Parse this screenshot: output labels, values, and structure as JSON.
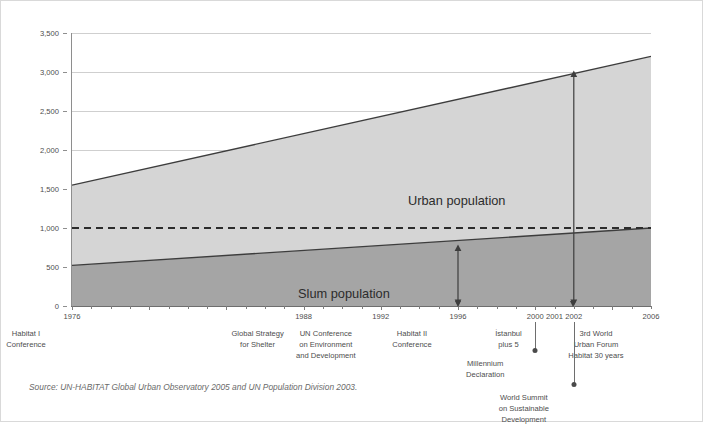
{
  "figure": {
    "y_axis_title": "Slum and urban population (millions)",
    "source_note": "Source: UN-HABITAT Global Urban Observatory 2005 and UN Population Division 2003.",
    "area_labels": {
      "urban": "Urban population",
      "slum": "Slum population"
    }
  },
  "chart_data": {
    "type": "area",
    "title": "",
    "xlabel": "",
    "ylabel": "Slum and urban population (millions)",
    "xlim": [
      1976,
      2006
    ],
    "ylim": [
      0,
      3500
    ],
    "ytick_values": [
      0,
      500,
      1000,
      1500,
      2000,
      2500,
      3000,
      3500
    ],
    "ytick_labels": [
      "0",
      "500",
      "1,000",
      "1,500",
      "2,000",
      "2,500",
      "3,000",
      "3,500"
    ],
    "grid": true,
    "legend_position": "inside-annotations",
    "reference_line": {
      "value": 1000,
      "style": "dashed",
      "label": ""
    },
    "x": [
      1976,
      2006
    ],
    "series": [
      {
        "name": "Urban population",
        "values": [
          1550,
          3200
        ],
        "stacked": true
      },
      {
        "name": "Slum population",
        "values": [
          520,
          1000
        ],
        "stacked": true
      }
    ],
    "xtick_years": [
      1976,
      1988,
      1992,
      1996,
      2000,
      2001,
      2002,
      2006
    ],
    "annotations": [
      {
        "year": 1996,
        "kind": "double-arrow",
        "from": 0,
        "to": 790
      },
      {
        "year": 2002,
        "kind": "double-arrow",
        "from": 0,
        "to": 3020
      }
    ]
  },
  "timeline": {
    "events": [
      {
        "year": "1976",
        "caption": "Habitat I\nConference"
      },
      {
        "year": "1988",
        "caption": "Global Strategy\nfor Shelter"
      },
      {
        "year": "1992",
        "caption": "UN Conference\non Environment\nand Development"
      },
      {
        "year": "1996",
        "caption": "Habitat II\nConference"
      },
      {
        "year": "2000",
        "caption": ""
      },
      {
        "year": "2001",
        "caption": "İstanbul\nplus 5"
      },
      {
        "year": "2002",
        "caption": ""
      },
      {
        "year": "2006",
        "caption": "3rd World\nUrban Forum\nHabitat 30 years"
      }
    ],
    "pins": [
      {
        "year": "2000",
        "label": "Millennium\nDeclaration"
      },
      {
        "year": "2002",
        "label": "World Summit\non Sustainable\nDevelopment"
      }
    ]
  },
  "colors": {
    "urban_fill": "#d5d5d5",
    "slum_fill": "#a5a5a5",
    "line": "#3d3d3d",
    "grid": "#cfcfcf",
    "axis": "#7d7d7d",
    "text": "#4d4d4d",
    "border": "#d9d9d9"
  }
}
